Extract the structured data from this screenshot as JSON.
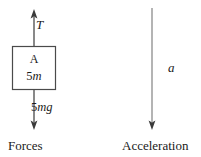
{
  "figure": {
    "type": "free-body-diagram",
    "stroke_color": "#4a4a4a",
    "text_color": "#1a1a1a",
    "background": "#ffffff"
  },
  "forces_panel": {
    "caption": "Forces",
    "body": {
      "name": "A",
      "mass_prefix": "5",
      "mass_symbol": "m"
    },
    "tension": {
      "label": "T",
      "direction": "up"
    },
    "weight": {
      "prefix": "5",
      "symbol": "mg",
      "direction": "down"
    }
  },
  "acceleration_panel": {
    "caption": "Acceleration",
    "arrow": {
      "label": "a",
      "direction": "down"
    }
  }
}
